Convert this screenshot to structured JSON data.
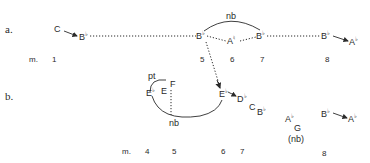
{
  "diagram": {
    "section_a": {
      "label": "a.",
      "measure_prefix": "m.",
      "notes": [
        {
          "id": "a-c",
          "name": "C",
          "acc": ""
        },
        {
          "id": "a-bb1",
          "name": "B",
          "acc": "♭"
        },
        {
          "id": "a-bb5",
          "name": "B",
          "acc": "♭"
        },
        {
          "id": "a-an6",
          "name": "A",
          "acc": "♮"
        },
        {
          "id": "a-bb7",
          "name": "B",
          "acc": "♭"
        },
        {
          "id": "a-bb8",
          "name": "B",
          "acc": "♭"
        },
        {
          "id": "a-ab8",
          "name": "A",
          "acc": "♭"
        }
      ],
      "slur_label": "nb",
      "measures": [
        "1",
        "5",
        "6",
        "7",
        "8"
      ]
    },
    "section_b": {
      "label": "b.",
      "measure_prefix": "m.",
      "notes": [
        {
          "id": "b-eb4",
          "name": "E",
          "acc": "♭"
        },
        {
          "id": "b-e4",
          "name": "E",
          "acc": ""
        },
        {
          "id": "b-f5",
          "name": "F",
          "acc": ""
        },
        {
          "id": "b-eb6",
          "name": "E",
          "acc": "♭"
        },
        {
          "id": "b-db6",
          "name": "D",
          "acc": "♭"
        },
        {
          "id": "b-c7",
          "name": "C",
          "acc": ""
        },
        {
          "id": "b-bb7",
          "name": "B",
          "acc": "♭"
        },
        {
          "id": "b-ab",
          "name": "A",
          "acc": "♭"
        },
        {
          "id": "b-g",
          "name": "G",
          "acc": ""
        },
        {
          "id": "b-bb8",
          "name": "B",
          "acc": "♭"
        },
        {
          "id": "b-ab8",
          "name": "A",
          "acc": "♭"
        }
      ],
      "pt_label": "pt",
      "nb_label": "nb",
      "nb_paren_label": "(nb)",
      "measures": [
        "4",
        "5",
        "6",
        "7",
        "8"
      ]
    },
    "colors": {
      "ink": "#2a2a2a",
      "background": "#ffffff"
    }
  }
}
